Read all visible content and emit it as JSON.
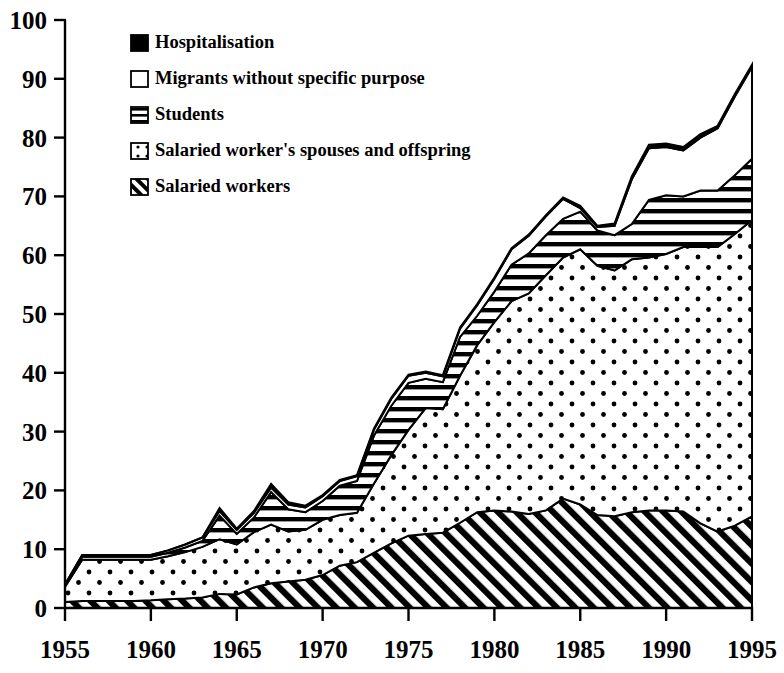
{
  "chart_data": {
    "type": "area",
    "stacked": true,
    "title": "",
    "xlabel": "",
    "ylabel": "",
    "xlim": [
      1955,
      1995
    ],
    "ylim": [
      0,
      100
    ],
    "ytick_step": 10,
    "xtick_step": 5,
    "grid": false,
    "legend_position": "top-left",
    "x": [
      1955,
      1956,
      1957,
      1958,
      1959,
      1960,
      1961,
      1962,
      1963,
      1964,
      1965,
      1966,
      1967,
      1968,
      1969,
      1970,
      1971,
      1972,
      1973,
      1974,
      1975,
      1976,
      1977,
      1978,
      1979,
      1980,
      1981,
      1982,
      1983,
      1984,
      1985,
      1986,
      1987,
      1988,
      1989,
      1990,
      1991,
      1992,
      1993,
      1994,
      1995
    ],
    "xtick_labels": [
      "1955",
      "1960",
      "1965",
      "1970",
      "1975",
      "1980",
      "1985",
      "1990",
      "1995"
    ],
    "ytick_labels": [
      "0",
      "10",
      "20",
      "30",
      "40",
      "50",
      "60",
      "70",
      "80",
      "90",
      "100"
    ],
    "series": [
      {
        "name": "Salaried workers",
        "pattern": "diagonal-hatch",
        "values": [
          1.0,
          1.2,
          1.2,
          1.2,
          1.2,
          1.3,
          1.5,
          1.6,
          1.8,
          2.4,
          2.3,
          3.5,
          4.2,
          4.5,
          4.8,
          5.6,
          7.2,
          7.8,
          9.4,
          11.0,
          12.3,
          12.6,
          12.8,
          14.5,
          16.3,
          16.6,
          16.4,
          16.0,
          16.6,
          18.6,
          17.6,
          15.8,
          15.6,
          16.3,
          16.6,
          16.6,
          16.4,
          14.4,
          13.0,
          14.0,
          15.6
        ]
      },
      {
        "name": "Salaried worker's spouses and offspring",
        "pattern": "dotted",
        "values": [
          2.6,
          7.0,
          7.0,
          7.0,
          7.0,
          6.9,
          7.3,
          7.9,
          8.6,
          9.3,
          8.5,
          9.4,
          10.0,
          8.5,
          8.5,
          9.4,
          8.6,
          8.4,
          11.8,
          15.0,
          18.0,
          21.4,
          21.0,
          25.0,
          28.4,
          32.0,
          35.8,
          37.5,
          40.0,
          41.0,
          43.4,
          42.4,
          41.8,
          43.0,
          43.0,
          43.6,
          45.0,
          47.0,
          48.4,
          49.6,
          50.4
        ]
      },
      {
        "name": "Students",
        "pattern": "horizontal-lines",
        "values": [
          0.2,
          0.5,
          0.5,
          0.5,
          0.5,
          0.5,
          0.6,
          0.8,
          1.0,
          4.0,
          1.8,
          2.5,
          5.5,
          3.8,
          3.0,
          3.2,
          5.0,
          5.4,
          8.2,
          8.4,
          8.0,
          5.0,
          4.6,
          6.6,
          5.0,
          5.2,
          6.2,
          6.8,
          6.8,
          6.6,
          6.4,
          6.0,
          6.0,
          6.0,
          9.8,
          10.0,
          8.6,
          9.6,
          9.6,
          10.0,
          10.4
        ]
      },
      {
        "name": "Migrants without specific purpose",
        "pattern": "white",
        "values": [
          0.2,
          0.3,
          0.3,
          0.3,
          0.3,
          0.3,
          0.4,
          0.5,
          0.6,
          0.8,
          0.7,
          0.8,
          0.8,
          0.8,
          0.8,
          0.8,
          0.8,
          0.8,
          1.0,
          1.2,
          1.2,
          1.0,
          1.0,
          1.4,
          1.8,
          2.2,
          2.6,
          3.0,
          3.2,
          3.4,
          0.6,
          0.6,
          1.6,
          7.6,
          8.8,
          8.2,
          7.8,
          9.0,
          10.6,
          13.4,
          15.6
        ]
      },
      {
        "name": "Hospitalisation",
        "pattern": "solid-black",
        "values": [
          0.0,
          0.0,
          0.0,
          0.0,
          0.0,
          0.0,
          0.0,
          0.0,
          0.0,
          0.5,
          0.2,
          0.3,
          0.6,
          0.4,
          0.3,
          0.2,
          0.2,
          0.2,
          0.2,
          0.2,
          0.2,
          0.2,
          0.2,
          0.2,
          0.2,
          0.2,
          0.2,
          0.2,
          0.2,
          0.2,
          0.4,
          0.2,
          0.4,
          0.5,
          0.6,
          0.6,
          0.6,
          0.6,
          0.4,
          0.4,
          0.4
        ]
      }
    ],
    "legend": [
      {
        "label": "Hospitalisation",
        "pattern": "solid-black"
      },
      {
        "label": "Migrants without specific purpose",
        "pattern": "white"
      },
      {
        "label": "Students",
        "pattern": "horizontal-lines"
      },
      {
        "label": "Salaried worker's spouses and offspring",
        "pattern": "dotted"
      },
      {
        "label": "Salaried workers",
        "pattern": "diagonal-hatch"
      }
    ],
    "colors": {
      "ink": "#000000",
      "background": "#ffffff"
    }
  }
}
